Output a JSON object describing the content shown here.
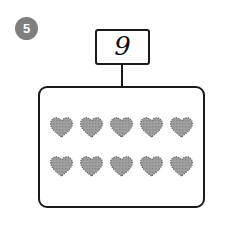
{
  "page": {
    "background_color": "#ffffff",
    "width": 227,
    "height": 226
  },
  "question": {
    "number_badge": {
      "label": "5",
      "shape": "circle",
      "fill_color": "#7f7f7f",
      "text_color": "#ffffff"
    }
  },
  "sign": {
    "value": "9",
    "border_color": "#1a1a1a",
    "fill_color": "#ffffff",
    "post_color": "#1a1a1a"
  },
  "count_box": {
    "border_color": "#1a1a1a",
    "fill_color": "#ffffff",
    "corner_radius": 9
  },
  "objects": {
    "shape_name": "heart",
    "fill_color": "#9a9a9a",
    "outline_color": "#5e5e5e",
    "texture": "stippled",
    "total_count": 10,
    "rows": [
      {
        "count": 5,
        "items": [
          "heart",
          "heart",
          "heart",
          "heart",
          "heart"
        ]
      },
      {
        "count": 5,
        "items": [
          "heart",
          "heart",
          "heart",
          "heart",
          "heart"
        ]
      }
    ]
  }
}
